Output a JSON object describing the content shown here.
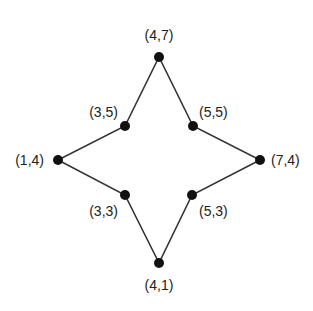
{
  "diagram": {
    "type": "star-polygon",
    "line_color": "#333333",
    "point_color": "#111111",
    "points": [
      {
        "label": "(4,7)",
        "x": 4,
        "y": 7,
        "px": 159,
        "py": 57,
        "lx": 159,
        "ly": 40,
        "anchor": "middle"
      },
      {
        "label": "(5,5)",
        "x": 5,
        "y": 5,
        "px": 193,
        "py": 126,
        "lx": 199,
        "ly": 117,
        "anchor": "start"
      },
      {
        "label": "(7,4)",
        "x": 7,
        "y": 4,
        "px": 260,
        "py": 160,
        "lx": 271,
        "ly": 165,
        "anchor": "start"
      },
      {
        "label": "(5,3)",
        "x": 5,
        "y": 3,
        "px": 192,
        "py": 195,
        "lx": 199,
        "ly": 216,
        "anchor": "start"
      },
      {
        "label": "(4,1)",
        "x": 4,
        "y": 1,
        "px": 159,
        "py": 263,
        "lx": 159,
        "ly": 290,
        "anchor": "middle"
      },
      {
        "label": "(3,3)",
        "x": 3,
        "y": 3,
        "px": 125,
        "py": 195,
        "lx": 118,
        "ly": 216,
        "anchor": "end"
      },
      {
        "label": "(1,4)",
        "x": 1,
        "y": 4,
        "px": 58,
        "py": 160,
        "lx": 44,
        "ly": 165,
        "anchor": "end"
      },
      {
        "label": "(3,5)",
        "x": 3,
        "y": 5,
        "px": 125,
        "py": 126,
        "lx": 118,
        "ly": 117,
        "anchor": "end"
      }
    ]
  }
}
